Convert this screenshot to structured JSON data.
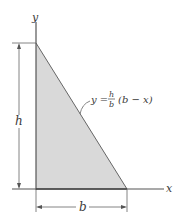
{
  "diagram": {
    "axes": {
      "x_label": "x",
      "y_label": "y"
    },
    "curve_label": {
      "lhs": "y =",
      "frac_num": "h",
      "frac_den": "b",
      "rhs": "(b − x)"
    },
    "dimensions": {
      "height_label": "h",
      "base_label": "b"
    },
    "colors": {
      "fill": "#d9d9d9",
      "line": "#555555",
      "text": "#3a3a3a"
    }
  }
}
